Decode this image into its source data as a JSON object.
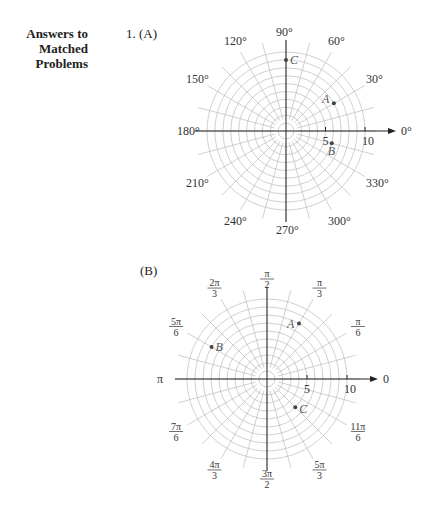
{
  "heading": {
    "line1": "Answers to",
    "line2": "Matched Problems"
  },
  "problem_number": "1. (A)",
  "part_b": "(B)",
  "chart_data": [
    {
      "type": "polar",
      "title": "(A)",
      "angle_labels": [
        "0°",
        "30°",
        "60°",
        "90°",
        "120°",
        "150°",
        "180°",
        "210°",
        "240°",
        "270°",
        "300°",
        "330°"
      ],
      "radial_ticks": [
        5,
        10
      ],
      "rings": 10,
      "radial_line_step_deg": 15,
      "points": [
        {
          "name": "A",
          "r": 7,
          "theta_deg": 30
        },
        {
          "name": "B",
          "r": 6,
          "theta_deg": -15
        },
        {
          "name": "C",
          "r": 9,
          "theta_deg": 90
        }
      ]
    },
    {
      "type": "polar",
      "title": "(B)",
      "angle_labels": [
        "0",
        "π/6",
        "π/3",
        "π/2",
        "2π/3",
        "5π/6",
        "π",
        "7π/6",
        "4π/3",
        "3π/2",
        "5π/3",
        "11π/6"
      ],
      "radial_ticks": [
        5,
        10
      ],
      "rings": 10,
      "radial_line_step_deg": 15,
      "points": [
        {
          "name": "A",
          "r": 8,
          "theta": "π/3"
        },
        {
          "name": "B",
          "r": 8,
          "theta": "5π/6"
        },
        {
          "name": "C",
          "r": 5,
          "theta": "-π/4"
        }
      ]
    }
  ]
}
